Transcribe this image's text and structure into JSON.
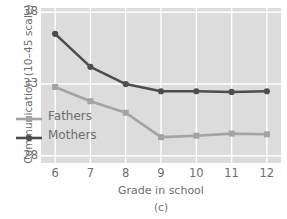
{
  "chart_data": {
    "type": "line",
    "title": "",
    "caption": "(c)",
    "xlabel": "Grade in school",
    "ylabel": "Communication (10–45 scale)",
    "x": [
      6,
      7,
      8,
      9,
      10,
      11,
      12
    ],
    "xticklabels": [
      "6",
      "7",
      "8",
      "9",
      "10",
      "11",
      "12"
    ],
    "yticklabels": [
      "38",
      "33",
      "28"
    ],
    "yticks": [
      38,
      33,
      28
    ],
    "xlim": [
      5.6,
      12.4
    ],
    "ylim": [
      27.5,
      38.3
    ],
    "grid": true,
    "grid_color": "#ffffff",
    "plot_background": "#dcdcdc",
    "legend_position": "lower-left-inside",
    "series": [
      {
        "name": "Fathers",
        "color": "#a3a3a3",
        "marker": "square",
        "values": [
          32.8,
          31.8,
          31.0,
          29.3,
          29.4,
          29.55,
          29.5
        ]
      },
      {
        "name": "Mothers",
        "color": "#4d4d4d",
        "marker": "circle",
        "values": [
          36.5,
          34.2,
          33.0,
          32.5,
          32.5,
          32.45,
          32.5
        ]
      }
    ]
  },
  "legend": {
    "items": [
      {
        "label": "Fathers"
      },
      {
        "label": "Mothers"
      }
    ]
  }
}
